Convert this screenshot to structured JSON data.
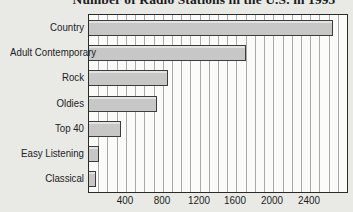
{
  "title": "Number of Radio Stations in the U.S. in 1995",
  "colors": {
    "background": "#e9e9e6",
    "plot_background": "#fbfbfa",
    "plot_border": "#2a2a2a",
    "gridline": "#a9a9a9",
    "bar_fill": "#c7c7c7",
    "bar_border": "#3c3c3c",
    "text": "#1c1c1c"
  },
  "chart_data": {
    "type": "bar",
    "orientation": "horizontal",
    "title": "Number of Radio Stations in the U.S. in 1995",
    "title_note_visible_portion": "of Radio Stations in the U.S. in 1995",
    "categories": [
      "Country",
      "Adult Contemporary",
      "Rock",
      "Oldies",
      "Top 40",
      "Easy Listening",
      "Classical"
    ],
    "values": [
      2650,
      1700,
      860,
      740,
      350,
      110,
      80
    ],
    "xlabel": "",
    "ylabel": "",
    "xlim": [
      0,
      2800
    ],
    "x_tick_values": [
      400,
      800,
      1200,
      1600,
      2000,
      2400
    ],
    "x_tick_labels": [
      "400",
      "800",
      "1200",
      "1600",
      "2000",
      "2400"
    ],
    "minor_grid_step": 100,
    "grid": "vertical minor gridlines, full height, behind bars",
    "legend": "none"
  }
}
